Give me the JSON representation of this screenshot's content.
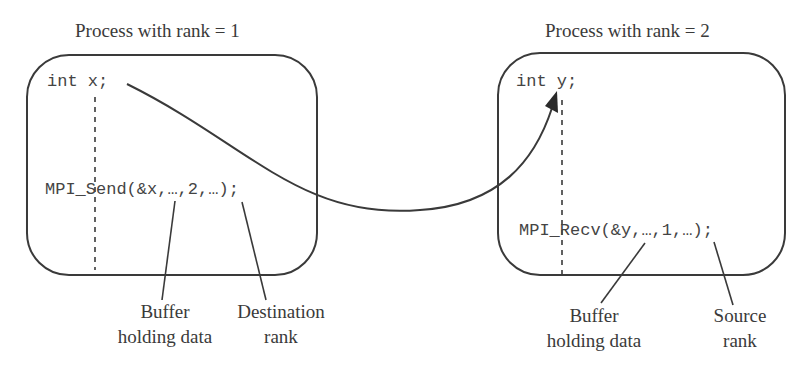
{
  "colors": {
    "stroke": "#3a3a3a",
    "text": "#3a3a3a",
    "code_text": "#444444",
    "background": "#ffffff"
  },
  "process_1": {
    "title": "Process with rank = 1",
    "declaration": "int x;",
    "call": "MPI_Send(&x,…,2,…);",
    "annotations": [
      {
        "line1": "Buffer",
        "line2": "holding data"
      },
      {
        "line1": "Destination",
        "line2": "rank"
      }
    ]
  },
  "process_2": {
    "title": "Process with rank = 2",
    "declaration": "int y;",
    "call": "MPI_Recv(&y,…,1,…);",
    "annotations": [
      {
        "line1": "Buffer",
        "line2": "holding data"
      },
      {
        "line1": "Source",
        "line2": "rank"
      }
    ]
  },
  "arrow": {
    "from": "x",
    "to": "y",
    "meaning": "data transfer"
  }
}
